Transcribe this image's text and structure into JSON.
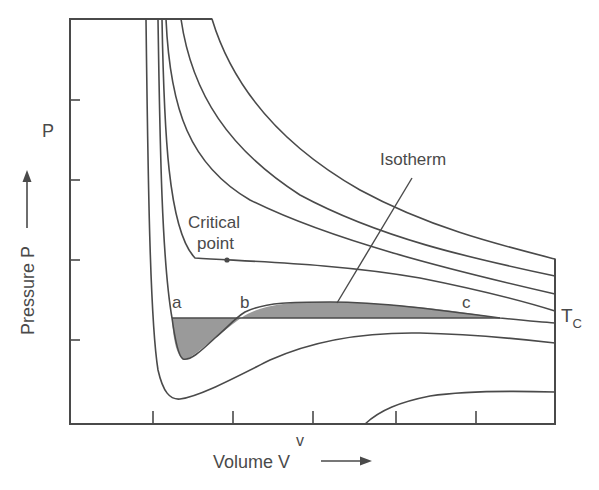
{
  "diagram": {
    "axes": {
      "y_label": "Pressure P",
      "y_inner_label": "P",
      "x_label": "Volume V",
      "x_inner_label": "v",
      "y_ticks": 4,
      "x_ticks": 5
    },
    "annotations": {
      "isotherm": "Isotherm",
      "critical_point_line1": "Critical",
      "critical_point_line2": "point",
      "point_a": "a",
      "point_b": "b",
      "point_c": "c",
      "critical_temp_main": "T",
      "critical_temp_sub": "C"
    },
    "colors": {
      "line": "#4a4a4a",
      "shade": "#9a9a9a",
      "background": "#ffffff"
    },
    "curves": [
      {
        "name": "isotherm-highest",
        "description": "Highest temperature hyperbola"
      },
      {
        "name": "isotherm-high-2",
        "description": "Second hyperbola"
      },
      {
        "name": "isotherm-high-3",
        "description": "Third hyperbola"
      },
      {
        "name": "isotherm-critical",
        "description": "Critical isotherm Tc with inflection at the critical point"
      },
      {
        "name": "isotherm-below-critical",
        "description": "Subcritical isotherm with van der Waals loop a–b–c and Maxwell construction"
      },
      {
        "name": "isotherm-low",
        "description": "Low temperature isotherm with deep minimum"
      },
      {
        "name": "isotherm-lowest",
        "description": "Lowest isotherm rising from the volume axis"
      }
    ]
  }
}
